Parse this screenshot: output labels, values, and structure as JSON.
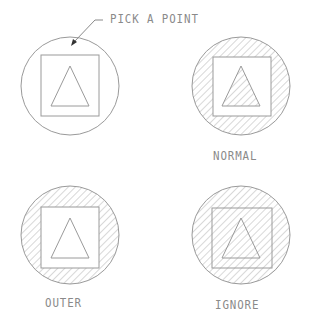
{
  "diagram": {
    "callout": {
      "label": "PICK A POINT"
    },
    "panels": [
      {
        "id": "pick",
        "label": "",
        "hatch": "none"
      },
      {
        "id": "normal",
        "label": "NORMAL",
        "hatch": "alternate"
      },
      {
        "id": "outer",
        "label": "OUTER",
        "hatch": "outermost"
      },
      {
        "id": "ignore",
        "label": "IGNORE",
        "hatch": "all"
      }
    ],
    "colors": {
      "line": "#9a9a9a",
      "hatch": "#a8a8a8",
      "background": "#ffffff"
    }
  }
}
